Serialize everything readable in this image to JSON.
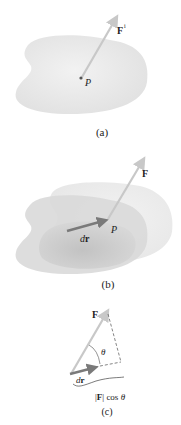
{
  "panels": [
    {
      "id": "a",
      "caption": "(a)",
      "force_label": "F",
      "force_superscript": "i",
      "point_label": "P"
    },
    {
      "id": "b",
      "caption": "(b)",
      "force_label": "F",
      "displacement_label_d": "d",
      "displacement_label_r": "r",
      "point_label": "P"
    },
    {
      "id": "c",
      "caption": "(c)",
      "force_label": "F",
      "angle_label": "θ",
      "displacement_label_d": "d",
      "displacement_label_r": "r",
      "projection_bar_open": "|",
      "projection_F": "F",
      "projection_bar_close": "|",
      "projection_cos": " cos ",
      "projection_theta": "θ"
    }
  ],
  "colors": {
    "body_light": "#e6e6e6",
    "body_dark": "#bdbdbd",
    "force_arrow": "#c8c8c8",
    "displacement_arrow": "#8a8a8a",
    "text": "#222222"
  }
}
